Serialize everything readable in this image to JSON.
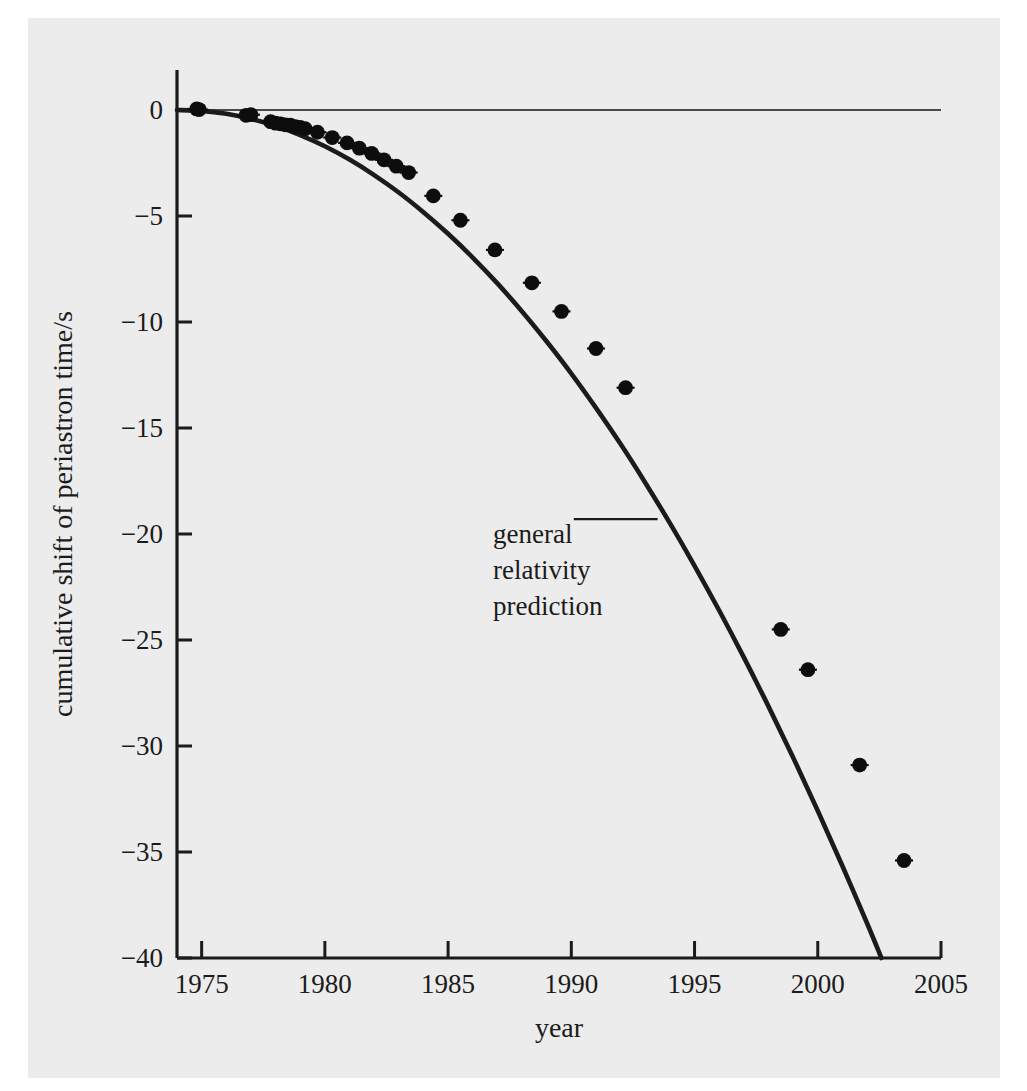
{
  "chart_data": {
    "type": "line",
    "title": "",
    "subtitle": "",
    "xlabel": "year",
    "ylabel": "cumulative shift of periastron time/s",
    "xlim": [
      1974,
      2005
    ],
    "ylim": [
      -40,
      1.2
    ],
    "xticks": [
      1975,
      1980,
      1985,
      1990,
      1995,
      2000,
      2005
    ],
    "xticklabels": [
      "1975",
      "1980",
      "1985",
      "1990",
      "1995",
      "2000",
      "2005"
    ],
    "yticks": [
      0,
      -5,
      -10,
      -15,
      -20,
      -25,
      -30,
      -35,
      -40
    ],
    "yticklabels": [
      "0",
      "−5",
      "−10",
      "−15",
      "−20",
      "−25",
      "−30",
      "−35",
      "−40"
    ],
    "grid": false,
    "legend": null,
    "zero_reference_line": {
      "y": 0,
      "x_from": 1974,
      "x_to": 2005
    },
    "annotations": [
      {
        "name": "general-relativity-prediction",
        "lines": [
          "general",
          "relativity",
          "prediction"
        ],
        "text": "general relativity prediction",
        "leader_line": {
          "x_from": 1990.1,
          "x_to": 1993.5,
          "y": -19.3
        }
      }
    ],
    "series": [
      {
        "name": "general relativity prediction",
        "kind": "curve",
        "style": "solid-black-line",
        "x": [
          1974.0,
          1975.0,
          1976.0,
          1977.0,
          1978.0,
          1979.0,
          1980.0,
          1981.0,
          1982.0,
          1983.0,
          1984.0,
          1985.0,
          1986.0,
          1987.0,
          1988.0,
          1989.0,
          1990.0,
          1991.0,
          1992.0,
          1993.0,
          1994.0,
          1995.0,
          1996.0,
          1997.0,
          1998.0,
          1999.0,
          2000.0,
          2001.0,
          2002.0,
          2003.0,
          2004.0,
          2005.0
        ],
        "y": [
          0.0,
          -0.04,
          -0.18,
          -0.42,
          -0.75,
          -1.18,
          -1.71,
          -2.34,
          -3.07,
          -3.89,
          -4.82,
          -5.84,
          -6.96,
          -8.18,
          -9.5,
          -10.92,
          -12.43,
          -14.05,
          -15.76,
          -17.58,
          -19.49,
          -21.5,
          -23.61,
          -25.82,
          -28.13,
          -30.54,
          -33.05,
          -35.66,
          -38.36,
          -41.17,
          -44.08,
          -47.08
        ]
      },
      {
        "name": "measured orbital phase shift",
        "kind": "points",
        "style": "black-dots-with-error-bars",
        "x": [
          1974.8,
          1974.9,
          1976.8,
          1977.0,
          1977.8,
          1978.0,
          1978.2,
          1978.4,
          1978.6,
          1978.8,
          1979.0,
          1979.2,
          1979.7,
          1980.3,
          1980.9,
          1981.4,
          1981.9,
          1982.4,
          1982.9,
          1983.4,
          1984.4,
          1985.5,
          1986.9,
          1988.4,
          1989.6,
          1991.0,
          1992.2,
          1998.5,
          1999.6,
          2001.7,
          2003.5
        ],
        "y": [
          0.05,
          0.02,
          -0.25,
          -0.22,
          -0.55,
          -0.62,
          -0.65,
          -0.7,
          -0.72,
          -0.78,
          -0.82,
          -0.88,
          -1.05,
          -1.3,
          -1.55,
          -1.8,
          -2.05,
          -2.35,
          -2.65,
          -2.95,
          -4.05,
          -5.2,
          -6.6,
          -8.15,
          -9.5,
          -11.25,
          -13.1,
          -24.5,
          -26.4,
          -30.9,
          -35.4
        ]
      }
    ]
  },
  "figure": {
    "axis_color": "#1b1b1b",
    "curve_color": "#1b1b1b",
    "marker_color": "#0d0d0d",
    "background_color": "#ececec",
    "page_color": "#ffffff"
  }
}
